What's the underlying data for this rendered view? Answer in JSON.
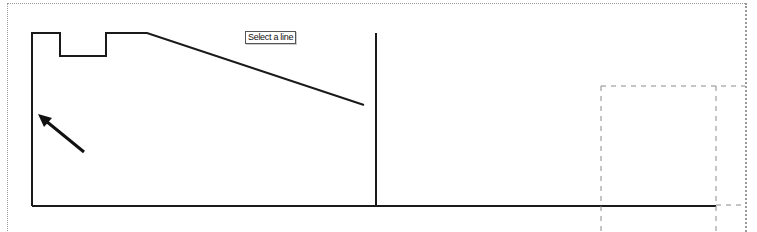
{
  "tooltip": {
    "text": "Select a line"
  },
  "drawing": {
    "line_color": "#1a1a1a",
    "dashed_color": "#8a8a8a",
    "frame_color": "#9a9a9a",
    "profile_points": "32,206 32,33 60,33 60,56 106,56 106,33 147,33 364,105",
    "vertical_line": {
      "x1": 376,
      "y1": 33,
      "x2": 376,
      "y2": 206
    },
    "base_line": {
      "x1": 32,
      "y1": 206,
      "x2": 716,
      "y2": 206
    },
    "arrow": {
      "x1": 84,
      "y1": 152,
      "x2": 42,
      "y2": 118
    }
  },
  "selection_box": {
    "left": 601,
    "top": 86,
    "right": 716
  }
}
